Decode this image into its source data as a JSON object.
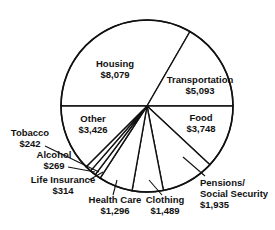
{
  "chart_data": {
    "type": "pie",
    "title": "",
    "center": [
      147,
      106
    ],
    "radius": 86,
    "slices": [
      {
        "label": "Housing",
        "value_label": "$8,079",
        "value": 8079,
        "start": 180,
        "end": 60,
        "lx": 115,
        "ly": 67
      },
      {
        "label": "Transportation",
        "value_label": "$5,093",
        "value": 5093,
        "start": 60,
        "end": 0,
        "lx": 200,
        "ly": 83
      },
      {
        "label": "Food",
        "value_label": "$3,748",
        "value": 3748,
        "start": 0,
        "end": -43,
        "lx": 201,
        "ly": 121
      },
      {
        "label": "Pensions/ Social Security",
        "value_label": "$1,935",
        "value": 1935,
        "start": -43,
        "end": -79,
        "lx": 229,
        "ly": 186
      },
      {
        "label": "Clothing",
        "value_label": "$1,489",
        "value": 1489,
        "start": -79,
        "end": -100,
        "lx": 165,
        "ly": 203
      },
      {
        "label": "Health Care",
        "value_label": "$1,296",
        "value": 1296,
        "start": -100,
        "end": -123,
        "lx": 115,
        "ly": 203
      },
      {
        "label": "Life Insurance",
        "value_label": "$314",
        "value": 314,
        "start": -123,
        "end": -127,
        "lx": 63,
        "ly": 183
      },
      {
        "label": "Alcohol",
        "value_label": "$269",
        "value": 269,
        "start": -127,
        "end": -131,
        "lx": 54,
        "ly": 158
      },
      {
        "label": "Tobacco",
        "value_label": "$242",
        "value": 242,
        "start": -131,
        "end": -135,
        "lx": 30,
        "ly": 136
      },
      {
        "label": "Other",
        "value_label": "$3,426",
        "value": 3426,
        "start": -135,
        "end": -180,
        "lx": 93,
        "ly": 122
      }
    ],
    "legend": "none",
    "stroke_color": "#111111",
    "fill_color": "#ffffff"
  }
}
